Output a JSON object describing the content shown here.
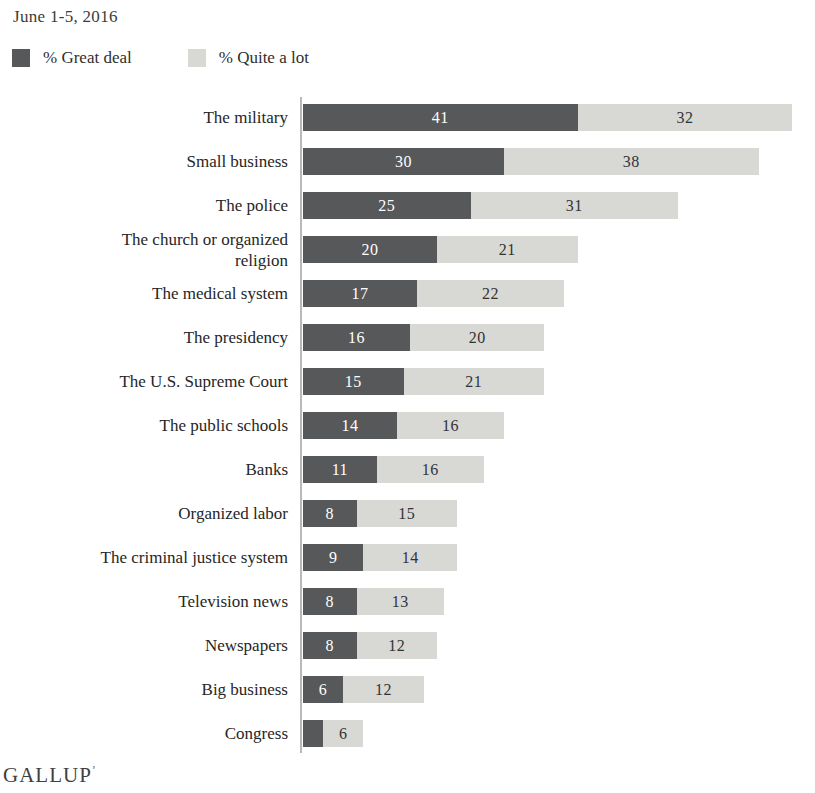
{
  "header": {
    "date_range": "June 1-5, 2016"
  },
  "legend": {
    "items": [
      {
        "label": "% Great deal",
        "color": "#57585A"
      },
      {
        "label": "% Quite a lot",
        "color": "#D8D8D5"
      }
    ]
  },
  "footer": {
    "brand": "GALLUP",
    "mark": "’"
  },
  "chart_data": {
    "type": "bar",
    "orientation": "horizontal",
    "stacked": true,
    "title": "June 1-5, 2016",
    "xlabel": "",
    "ylabel": "",
    "grid": false,
    "legend_position": "top-left",
    "categories": [
      "The military",
      "Small business",
      "The police",
      "The church or organized religion",
      "The medical system",
      "The presidency",
      "The U.S. Supreme Court",
      "The public schools",
      "Banks",
      "Organized labor",
      "The criminal justice system",
      "Television news",
      "Newspapers",
      "Big business",
      "Congress"
    ],
    "series": [
      {
        "name": "% Great deal",
        "color": "#57585A",
        "label_color": "#FFFFFF",
        "values": [
          41,
          30,
          25,
          20,
          17,
          16,
          15,
          14,
          11,
          8,
          9,
          8,
          8,
          6,
          3
        ]
      },
      {
        "name": "% Quite a lot",
        "color": "#D8D8D5",
        "label_color": "#333333",
        "values": [
          32,
          38,
          31,
          21,
          22,
          20,
          21,
          16,
          16,
          15,
          14,
          13,
          12,
          12,
          6
        ]
      }
    ],
    "value_label_min": 4,
    "xlim": [
      0,
      75
    ],
    "axis_color": "#B9B9B9"
  }
}
